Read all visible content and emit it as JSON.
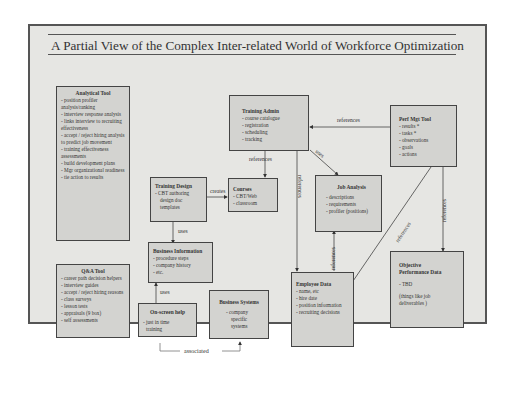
{
  "title": "A Partial View of the Complex Inter-related World of Workforce Optimization",
  "nodes": {
    "analytical_tool": {
      "title": "Analytical Tool",
      "items": [
        "- position profiler analysis/ranking",
        "- interview response analysis",
        "- links interview to recruiting effectiveness",
        "- accept / reject hiring analysis to predict job movement",
        "- training effectiveness assessments",
        "- build development plans",
        "- Mgr organizational readiness",
        "- tie action to results"
      ]
    },
    "qa_tool": {
      "title": "Q&A Tool",
      "items": [
        "- career path decision helpers",
        "- interview guides",
        "- accept / reject hiring reasons",
        "- class surveys",
        "- lesson tests",
        "- appraisals (9 box)",
        "- self assessments"
      ]
    },
    "training_admin": {
      "title": "Training Admin",
      "items": [
        "- course catalogue",
        "- registration",
        "- scheduling",
        "- tracking"
      ]
    },
    "perf_mgt_tool": {
      "title": "Perf Mgt Tool",
      "items": [
        "- results *",
        "- tasks *",
        "- observations",
        "- goals",
        "- actions"
      ]
    },
    "training_design": {
      "title": "Training Design",
      "items": [
        "- CBT authoring",
        "design doc",
        "templates"
      ]
    },
    "courses": {
      "title": "Courses",
      "items": [
        "- CBT/Web",
        "- classroom"
      ]
    },
    "job_analysis": {
      "title": "Job Analysis",
      "items": [
        "- descriptions",
        "- requirements",
        "- profiler (positions)"
      ]
    },
    "business_information": {
      "title": "Business Information",
      "items": [
        "- procedure steps",
        "- company history",
        "- etc."
      ]
    },
    "on_screen_help": {
      "title": "On-screen help",
      "items": [
        "- just in time",
        "training"
      ]
    },
    "business_systems": {
      "title": "Business Systems",
      "items": [
        "- company",
        "specific",
        "systems"
      ]
    },
    "employee_data": {
      "title": "Employee Data",
      "items": [
        "- name, etc",
        "- hire date",
        "- position information",
        "- recruiting decisions"
      ]
    },
    "objective_performance_data": {
      "title": "Objective Performance Data",
      "items": [
        "- TBD",
        "(things like job deliverables )"
      ]
    }
  },
  "edges": {
    "perf_to_training_admin": "references",
    "training_admin_to_courses": "references",
    "training_admin_to_job_analysis": "uses",
    "training_admin_to_employee_data": "references",
    "training_design_to_courses": "creates",
    "training_design_to_business_info": "uses",
    "on_screen_help_to_business_info": "uses",
    "on_screen_help_to_business_systems": "associated",
    "employee_data_to_job_analysis": "references",
    "perf_to_employee_data": "references",
    "perf_to_objective_data": "references"
  }
}
